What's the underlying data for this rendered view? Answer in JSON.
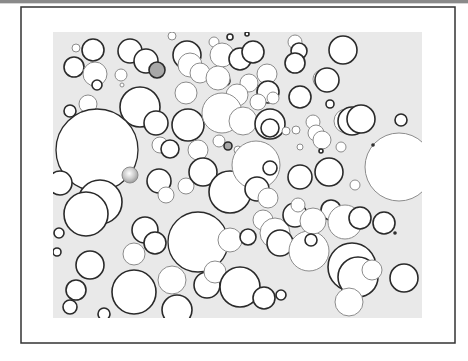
{
  "figure": {
    "colors": {
      "page_bg": "#ffffff",
      "frame": "#333333",
      "field_bg": "#e9e9e9",
      "circle_fill": "#ffffff",
      "circle_dark_stroke": "#2a2a2a",
      "circle_light_stroke": "#8c8c8c",
      "gray_fill": "#a8a8a8"
    },
    "frame": {
      "x": 21,
      "y": 7,
      "w": 434,
      "h": 336
    },
    "field": {
      "x": 53,
      "y": 32,
      "w": 369,
      "h": 286
    },
    "circles": [
      {
        "cx": 93,
        "cy": 50,
        "r": 11,
        "s": "d"
      },
      {
        "cx": 76,
        "cy": 48,
        "r": 4,
        "s": "l"
      },
      {
        "cx": 74,
        "cy": 67,
        "r": 10,
        "s": "d"
      },
      {
        "cx": 95,
        "cy": 74,
        "r": 12,
        "s": "l"
      },
      {
        "cx": 97,
        "cy": 85,
        "r": 5,
        "s": "d"
      },
      {
        "cx": 130,
        "cy": 51,
        "r": 12,
        "s": "d"
      },
      {
        "cx": 146,
        "cy": 61,
        "r": 12,
        "s": "d"
      },
      {
        "cx": 157,
        "cy": 70,
        "r": 8,
        "s": "d",
        "fill": "gray"
      },
      {
        "cx": 121,
        "cy": 75,
        "r": 6,
        "s": "l"
      },
      {
        "cx": 122,
        "cy": 85,
        "r": 2,
        "s": "l"
      },
      {
        "cx": 172,
        "cy": 36,
        "r": 4,
        "s": "l"
      },
      {
        "cx": 187,
        "cy": 55,
        "r": 14,
        "s": "d"
      },
      {
        "cx": 190,
        "cy": 65,
        "r": 12,
        "s": "l"
      },
      {
        "cx": 214,
        "cy": 42,
        "r": 5,
        "s": "l"
      },
      {
        "cx": 230,
        "cy": 37,
        "r": 3,
        "s": "d"
      },
      {
        "cx": 222,
        "cy": 55,
        "r": 12,
        "s": "l"
      },
      {
        "cx": 240,
        "cy": 59,
        "r": 11,
        "s": "d"
      },
      {
        "cx": 225,
        "cy": 81,
        "r": 5,
        "s": "d",
        "fill": "gray"
      },
      {
        "cx": 200,
        "cy": 73,
        "r": 10,
        "s": "l"
      },
      {
        "cx": 218,
        "cy": 78,
        "r": 12,
        "s": "l"
      },
      {
        "cx": 247,
        "cy": 34,
        "r": 2,
        "s": "d"
      },
      {
        "cx": 253,
        "cy": 52,
        "r": 11,
        "s": "d"
      },
      {
        "cx": 267,
        "cy": 74,
        "r": 10,
        "s": "l"
      },
      {
        "cx": 249,
        "cy": 83,
        "r": 9,
        "s": "l"
      },
      {
        "cx": 237,
        "cy": 95,
        "r": 11,
        "s": "l"
      },
      {
        "cx": 186,
        "cy": 93,
        "r": 11,
        "s": "l"
      },
      {
        "cx": 295,
        "cy": 42,
        "r": 7,
        "s": "l"
      },
      {
        "cx": 299,
        "cy": 51,
        "r": 8,
        "s": "d"
      },
      {
        "cx": 295,
        "cy": 63,
        "r": 10,
        "s": "d"
      },
      {
        "cx": 343,
        "cy": 50,
        "r": 14,
        "s": "d"
      },
      {
        "cx": 322,
        "cy": 79,
        "r": 9,
        "s": "l"
      },
      {
        "cx": 327,
        "cy": 80,
        "r": 12,
        "s": "d"
      },
      {
        "cx": 300,
        "cy": 97,
        "r": 11,
        "s": "d"
      },
      {
        "cx": 268,
        "cy": 92,
        "r": 11,
        "s": "d"
      },
      {
        "cx": 258,
        "cy": 102,
        "r": 8,
        "s": "l"
      },
      {
        "cx": 273,
        "cy": 98,
        "r": 6,
        "s": "l"
      },
      {
        "cx": 330,
        "cy": 104,
        "r": 4,
        "s": "d"
      },
      {
        "cx": 140,
        "cy": 107,
        "r": 20,
        "s": "d"
      },
      {
        "cx": 70,
        "cy": 111,
        "r": 6,
        "s": "d"
      },
      {
        "cx": 88,
        "cy": 104,
        "r": 9,
        "s": "l"
      },
      {
        "cx": 97,
        "cy": 150,
        "r": 41,
        "s": "d"
      },
      {
        "cx": 156,
        "cy": 123,
        "r": 12,
        "s": "d"
      },
      {
        "cx": 188,
        "cy": 125,
        "r": 16,
        "s": "d"
      },
      {
        "cx": 222,
        "cy": 113,
        "r": 20,
        "s": "l"
      },
      {
        "cx": 243,
        "cy": 121,
        "r": 14,
        "s": "l"
      },
      {
        "cx": 160,
        "cy": 145,
        "r": 8,
        "s": "l"
      },
      {
        "cx": 170,
        "cy": 149,
        "r": 9,
        "s": "d"
      },
      {
        "cx": 198,
        "cy": 150,
        "r": 10,
        "s": "l"
      },
      {
        "cx": 219,
        "cy": 141,
        "r": 6,
        "s": "l"
      },
      {
        "cx": 228,
        "cy": 146,
        "r": 4,
        "s": "d",
        "fill": "gray"
      },
      {
        "cx": 238,
        "cy": 150,
        "r": 4,
        "s": "l"
      },
      {
        "cx": 270,
        "cy": 124,
        "r": 15,
        "s": "d"
      },
      {
        "cx": 270,
        "cy": 128,
        "r": 9,
        "s": "d"
      },
      {
        "cx": 286,
        "cy": 131,
        "r": 4,
        "s": "l"
      },
      {
        "cx": 296,
        "cy": 130,
        "r": 4,
        "s": "l"
      },
      {
        "cx": 313,
        "cy": 122,
        "r": 7,
        "s": "l"
      },
      {
        "cx": 316,
        "cy": 133,
        "r": 8,
        "s": "l"
      },
      {
        "cx": 322,
        "cy": 140,
        "r": 9,
        "s": "l"
      },
      {
        "cx": 300,
        "cy": 147,
        "r": 3,
        "s": "l"
      },
      {
        "cx": 321,
        "cy": 151,
        "r": 2,
        "s": "d"
      },
      {
        "cx": 346,
        "cy": 121,
        "r": 12,
        "s": "l"
      },
      {
        "cx": 352,
        "cy": 121,
        "r": 14,
        "s": "d"
      },
      {
        "cx": 361,
        "cy": 119,
        "r": 14,
        "s": "d"
      },
      {
        "cx": 401,
        "cy": 120,
        "r": 6,
        "s": "d"
      },
      {
        "cx": 341,
        "cy": 147,
        "r": 5,
        "s": "l"
      },
      {
        "cx": 399,
        "cy": 167,
        "r": 34,
        "s": "l"
      },
      {
        "cx": 373,
        "cy": 145,
        "r": 1,
        "s": "d"
      },
      {
        "cx": 130,
        "cy": 175,
        "r": 8,
        "s": "l",
        "fill": "glossy"
      },
      {
        "cx": 159,
        "cy": 181,
        "r": 12,
        "s": "d"
      },
      {
        "cx": 166,
        "cy": 195,
        "r": 8,
        "s": "l"
      },
      {
        "cx": 186,
        "cy": 186,
        "r": 8,
        "s": "l"
      },
      {
        "cx": 203,
        "cy": 172,
        "r": 14,
        "s": "d"
      },
      {
        "cx": 230,
        "cy": 192,
        "r": 21,
        "s": "d"
      },
      {
        "cx": 256,
        "cy": 165,
        "r": 24,
        "s": "l"
      },
      {
        "cx": 270,
        "cy": 168,
        "r": 7,
        "s": "d"
      },
      {
        "cx": 300,
        "cy": 177,
        "r": 12,
        "s": "d"
      },
      {
        "cx": 329,
        "cy": 172,
        "r": 14,
        "s": "d"
      },
      {
        "cx": 355,
        "cy": 185,
        "r": 5,
        "s": "l"
      },
      {
        "cx": 60,
        "cy": 183,
        "r": 12,
        "s": "d"
      },
      {
        "cx": 100,
        "cy": 202,
        "r": 22,
        "s": "d"
      },
      {
        "cx": 86,
        "cy": 214,
        "r": 22,
        "s": "d"
      },
      {
        "cx": 59,
        "cy": 233,
        "r": 5,
        "s": "d"
      },
      {
        "cx": 145,
        "cy": 230,
        "r": 13,
        "s": "d"
      },
      {
        "cx": 155,
        "cy": 243,
        "r": 11,
        "s": "d"
      },
      {
        "cx": 134,
        "cy": 254,
        "r": 11,
        "s": "l"
      },
      {
        "cx": 198,
        "cy": 242,
        "r": 30,
        "s": "d"
      },
      {
        "cx": 230,
        "cy": 240,
        "r": 12,
        "s": "l"
      },
      {
        "cx": 257,
        "cy": 189,
        "r": 12,
        "s": "d"
      },
      {
        "cx": 268,
        "cy": 198,
        "r": 10,
        "s": "l"
      },
      {
        "cx": 263,
        "cy": 220,
        "r": 10,
        "s": "l"
      },
      {
        "cx": 275,
        "cy": 233,
        "r": 15,
        "s": "l"
      },
      {
        "cx": 280,
        "cy": 243,
        "r": 13,
        "s": "d"
      },
      {
        "cx": 295,
        "cy": 215,
        "r": 12,
        "s": "d"
      },
      {
        "cx": 298,
        "cy": 205,
        "r": 7,
        "s": "l"
      },
      {
        "cx": 331,
        "cy": 210,
        "r": 10,
        "s": "d"
      },
      {
        "cx": 345,
        "cy": 222,
        "r": 17,
        "s": "l"
      },
      {
        "cx": 360,
        "cy": 218,
        "r": 11,
        "s": "d"
      },
      {
        "cx": 384,
        "cy": 223,
        "r": 11,
        "s": "d"
      },
      {
        "cx": 395,
        "cy": 233,
        "r": 1,
        "s": "d"
      },
      {
        "cx": 90,
        "cy": 265,
        "r": 14,
        "s": "d"
      },
      {
        "cx": 76,
        "cy": 290,
        "r": 10,
        "s": "d"
      },
      {
        "cx": 70,
        "cy": 307,
        "r": 7,
        "s": "d"
      },
      {
        "cx": 104,
        "cy": 314,
        "r": 6,
        "s": "d"
      },
      {
        "cx": 134,
        "cy": 292,
        "r": 22,
        "s": "d"
      },
      {
        "cx": 172,
        "cy": 280,
        "r": 14,
        "s": "l"
      },
      {
        "cx": 177,
        "cy": 310,
        "r": 15,
        "s": "d"
      },
      {
        "cx": 207,
        "cy": 285,
        "r": 13,
        "s": "d"
      },
      {
        "cx": 215,
        "cy": 272,
        "r": 11,
        "s": "l"
      },
      {
        "cx": 240,
        "cy": 287,
        "r": 20,
        "s": "d"
      },
      {
        "cx": 264,
        "cy": 298,
        "r": 11,
        "s": "d"
      },
      {
        "cx": 281,
        "cy": 295,
        "r": 5,
        "s": "d"
      },
      {
        "cx": 248,
        "cy": 237,
        "r": 8,
        "s": "d"
      },
      {
        "cx": 309,
        "cy": 251,
        "r": 20,
        "s": "l"
      },
      {
        "cx": 313,
        "cy": 221,
        "r": 13,
        "s": "l"
      },
      {
        "cx": 311,
        "cy": 240,
        "r": 6,
        "s": "d"
      },
      {
        "cx": 352,
        "cy": 267,
        "r": 24,
        "s": "d"
      },
      {
        "cx": 358,
        "cy": 277,
        "r": 20,
        "s": "d"
      },
      {
        "cx": 372,
        "cy": 270,
        "r": 10,
        "s": "l"
      },
      {
        "cx": 349,
        "cy": 302,
        "r": 14,
        "s": "l"
      },
      {
        "cx": 404,
        "cy": 278,
        "r": 14,
        "s": "d"
      },
      {
        "cx": 57,
        "cy": 252,
        "r": 4,
        "s": "d"
      }
    ]
  }
}
